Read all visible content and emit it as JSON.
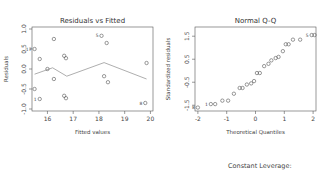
{
  "chart_data": [
    {
      "type": "scatter",
      "title": "Residuals vs Fitted",
      "xlabel": "Fitted values",
      "ylabel": "Residuals",
      "xlim": [
        15.4,
        20.1
      ],
      "ylim": [
        -1.05,
        1.05
      ],
      "xticks": [
        16,
        17,
        18,
        19,
        20
      ],
      "yticks": [
        -1.0,
        -0.5,
        0.0,
        0.5,
        1.0
      ],
      "ytick_labels": [
        "-1.0",
        "-0.5",
        "0.0",
        "0.5",
        "1.0"
      ],
      "points": [
        {
          "x": 15.5,
          "y": 0.5,
          "label": "17"
        },
        {
          "x": 15.7,
          "y": 0.25
        },
        {
          "x": 16.0,
          "y": 0.0
        },
        {
          "x": 16.25,
          "y": 0.75
        },
        {
          "x": 16.25,
          "y": -0.25
        },
        {
          "x": 15.5,
          "y": -0.5
        },
        {
          "x": 15.7,
          "y": -0.75,
          "label": "1"
        },
        {
          "x": 16.65,
          "y": 0.33
        },
        {
          "x": 16.72,
          "y": 0.27
        },
        {
          "x": 16.65,
          "y": -0.67
        },
        {
          "x": 16.72,
          "y": -0.73
        },
        {
          "x": 18.1,
          "y": 0.83,
          "label": "5"
        },
        {
          "x": 18.3,
          "y": 0.65
        },
        {
          "x": 18.2,
          "y": -0.18
        },
        {
          "x": 18.35,
          "y": -0.33
        },
        {
          "x": 19.85,
          "y": 0.15
        },
        {
          "x": 19.8,
          "y": -0.85,
          "label": "8"
        }
      ],
      "smoother": [
        {
          "x": 15.5,
          "y": -0.13
        },
        {
          "x": 16.2,
          "y": 0.03
        },
        {
          "x": 16.75,
          "y": -0.18
        },
        {
          "x": 18.2,
          "y": 0.16
        },
        {
          "x": 19.85,
          "y": -0.25
        }
      ]
    },
    {
      "type": "scatter",
      "title": "Normal Q-Q",
      "xlabel": "Theoretical Quantiles",
      "ylabel": "Standardized residuals",
      "xlim": [
        -2.1,
        2.1
      ],
      "ylim": [
        -1.75,
        1.9
      ],
      "xticks": [
        -2,
        -1,
        0,
        1,
        2
      ],
      "yticks": [
        -1.5,
        -0.5,
        0.5,
        1.5
      ],
      "ytick_labels": [
        "-1.5",
        "-0.5",
        "0.5",
        "1.5"
      ],
      "points": [
        {
          "x": -2.0,
          "y": -1.6,
          "label": "8"
        },
        {
          "x": -1.55,
          "y": -1.45,
          "label": "1"
        },
        {
          "x": -1.4,
          "y": -1.45
        },
        {
          "x": -1.15,
          "y": -1.3
        },
        {
          "x": -0.95,
          "y": -1.3
        },
        {
          "x": -0.75,
          "y": -1.0
        },
        {
          "x": -0.55,
          "y": -0.75
        },
        {
          "x": -0.45,
          "y": -0.75
        },
        {
          "x": -0.3,
          "y": -0.6
        },
        {
          "x": -0.15,
          "y": -0.55
        },
        {
          "x": -0.05,
          "y": -0.45
        },
        {
          "x": 0.05,
          "y": -0.1
        },
        {
          "x": 0.15,
          "y": -0.1
        },
        {
          "x": 0.3,
          "y": 0.2
        },
        {
          "x": 0.45,
          "y": 0.3
        },
        {
          "x": 0.55,
          "y": 0.45
        },
        {
          "x": 0.7,
          "y": 0.55
        },
        {
          "x": 0.8,
          "y": 0.6
        },
        {
          "x": 0.95,
          "y": 0.85
        },
        {
          "x": 1.05,
          "y": 1.15
        },
        {
          "x": 1.15,
          "y": 1.15
        },
        {
          "x": 1.3,
          "y": 1.35
        },
        {
          "x": 1.55,
          "y": 1.35
        },
        {
          "x": 1.95,
          "y": 1.55,
          "label": "5"
        },
        {
          "x": 2.05,
          "y": 1.55
        }
      ]
    }
  ],
  "footer": {
    "third_plot_title": "Constant Leverage:"
  }
}
